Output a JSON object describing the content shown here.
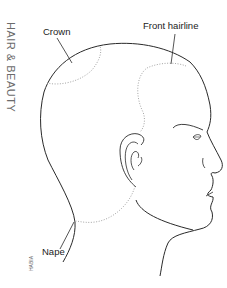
{
  "side_title": "HAIR & BEAUTY",
  "publisher_mark": "HABIA",
  "labels": {
    "crown": "Crown",
    "front_hairline": "Front hairline",
    "nape": "Nape"
  },
  "colors": {
    "outline": "#2a2a2a",
    "dotted": "#9a9a9a",
    "side_title": "#6b6b6b"
  }
}
